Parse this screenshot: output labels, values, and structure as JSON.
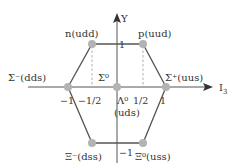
{
  "diagram": {
    "axes": {
      "x_label": "I",
      "x_label_sub": "3",
      "y_label": "Y"
    },
    "ticks": {
      "x_neg1": "−1",
      "x_neg_half": "−1/2",
      "x_half": "1/2",
      "x_pos1": "1",
      "y_pos1": "1",
      "y_neg1": "−1"
    },
    "particles": [
      {
        "id": "n",
        "label": "n(udd)",
        "I3": -0.5,
        "Y": 1
      },
      {
        "id": "p",
        "label": "p(uud)",
        "I3": 0.5,
        "Y": 1
      },
      {
        "id": "sigma_minus",
        "label": "Σ⁻(dds)",
        "I3": -1,
        "Y": 0
      },
      {
        "id": "sigma_zero",
        "label": "Σ⁰",
        "I3": 0,
        "Y": 0
      },
      {
        "id": "lambda_zero",
        "label": "Λ⁰",
        "label2": "(uds)",
        "I3": 0,
        "Y": 0
      },
      {
        "id": "sigma_plus",
        "label": "Σ⁺(uus)",
        "I3": 1,
        "Y": 0
      },
      {
        "id": "xi_minus",
        "label": "Ξ⁻(dss)",
        "I3": -0.5,
        "Y": -1
      },
      {
        "id": "xi_zero",
        "label": "Ξ⁰(uss)",
        "I3": 0.5,
        "Y": -1
      }
    ],
    "colors": {
      "line": "#555555",
      "point": "#b3b3b3",
      "dashed": "#888888",
      "text": "#333333"
    }
  }
}
